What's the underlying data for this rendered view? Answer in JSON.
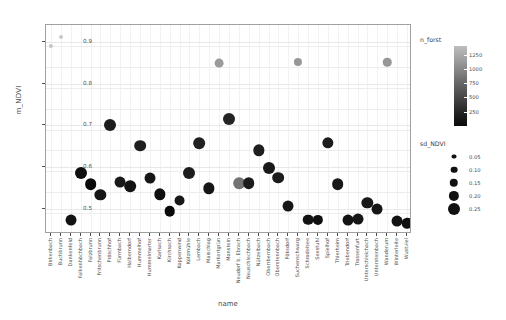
{
  "chart_data": {
    "type": "scatter",
    "title": "",
    "xlabel": "name",
    "ylabel": "m_NDVI",
    "ylim": [
      0.44,
      0.94
    ],
    "yticks": [
      0.5,
      0.6,
      0.7,
      0.8,
      0.9
    ],
    "ytick_labels": [
      "0.5",
      "0.6",
      "0.7",
      "0.8",
      "0.9"
    ],
    "grid": true,
    "legend_position": "right",
    "categories": [
      "Birkenbach",
      "Buchbrunn",
      "Dankenfeld",
      "Falkenhöchbach",
      "Falzbrunn",
      "Fritschenbrunn",
      "Pröschhof",
      "Fürmbach",
      "Halberndorf",
      "Hummelhof",
      "Hummelmarter",
      "Karlsach",
      "Kirchsach",
      "Koppenwind",
      "Kotzmühle",
      "Lembach",
      "Maischlag",
      "Markertgrün",
      "Monstein",
      "Neudorf b. Ebrach",
      "Neuschlechbach",
      "Nützelbach",
      "Oberrbernbach",
      "Oberstennbach",
      "Pöksdorf",
      "Suchenschwarg",
      "Schrodelsee",
      "Seestuhl",
      "Spielhof",
      "Thierheim",
      "Triebendorf",
      "Trossenfurt",
      "Unterschleichach",
      "Untersteinbach",
      "Wanderum",
      "Winterleite",
      "Wustviel"
    ],
    "points": [
      {
        "name": "Birkenbach",
        "m_NDVI": 0.89,
        "sd_NDVI": 0.03,
        "n_forst": 1230
      },
      {
        "name": "Buchbrunn",
        "m_NDVI": 0.912,
        "sd_NDVI": 0.02,
        "n_forst": 1250
      },
      {
        "name": "Dankenfeld",
        "m_NDVI": 0.473,
        "sd_NDVI": 0.22,
        "n_forst": 120
      },
      {
        "name": "Falkenhöchbach",
        "m_NDVI": 0.587,
        "sd_NDVI": 0.25,
        "n_forst": 110
      },
      {
        "name": "Falzbrunn",
        "m_NDVI": 0.559,
        "sd_NDVI": 0.24,
        "n_forst": 100
      },
      {
        "name": "Fritschenbrunn",
        "m_NDVI": 0.534,
        "sd_NDVI": 0.23,
        "n_forst": 130
      },
      {
        "name": "Pröschhof",
        "m_NDVI": 0.7,
        "sd_NDVI": 0.25,
        "n_forst": 150
      },
      {
        "name": "Fürmbach",
        "m_NDVI": 0.565,
        "sd_NDVI": 0.22,
        "n_forst": 140
      },
      {
        "name": "Halberndorf",
        "m_NDVI": 0.555,
        "sd_NDVI": 0.24,
        "n_forst": 120
      },
      {
        "name": "Hummelhof",
        "m_NDVI": 0.651,
        "sd_NDVI": 0.24,
        "n_forst": 160
      },
      {
        "name": "Hummelmarter",
        "m_NDVI": 0.575,
        "sd_NDVI": 0.22,
        "n_forst": 130
      },
      {
        "name": "Karlsach",
        "m_NDVI": 0.535,
        "sd_NDVI": 0.23,
        "n_forst": 110
      },
      {
        "name": "Kirchsach",
        "m_NDVI": 0.494,
        "sd_NDVI": 0.21,
        "n_forst": 100
      },
      {
        "name": "Koppenwind",
        "m_NDVI": 0.52,
        "sd_NDVI": 0.22,
        "n_forst": 140
      },
      {
        "name": "Kotzmühle",
        "m_NDVI": 0.587,
        "sd_NDVI": 0.25,
        "n_forst": 150
      },
      {
        "name": "Lembach",
        "m_NDVI": 0.657,
        "sd_NDVI": 0.24,
        "n_forst": 170
      },
      {
        "name": "Maischlag",
        "m_NDVI": 0.549,
        "sd_NDVI": 0.23,
        "n_forst": 130
      },
      {
        "name": "Markertgrün",
        "m_NDVI": 0.848,
        "sd_NDVI": 0.16,
        "n_forst": 900
      },
      {
        "name": "Monstein",
        "m_NDVI": 0.716,
        "sd_NDVI": 0.25,
        "n_forst": 180
      },
      {
        "name": "Neudorf b. Ebrach",
        "m_NDVI": 0.561,
        "sd_NDVI": 0.24,
        "n_forst": 620
      },
      {
        "name": "Neuschlechbach",
        "m_NDVI": 0.562,
        "sd_NDVI": 0.24,
        "n_forst": 150
      },
      {
        "name": "Nützelbach",
        "m_NDVI": 0.64,
        "sd_NDVI": 0.23,
        "n_forst": 160
      },
      {
        "name": "Oberrbernbach",
        "m_NDVI": 0.597,
        "sd_NDVI": 0.25,
        "n_forst": 140
      },
      {
        "name": "Oberstennbach",
        "m_NDVI": 0.575,
        "sd_NDVI": 0.24,
        "n_forst": 150
      },
      {
        "name": "Pöksdorf",
        "m_NDVI": 0.506,
        "sd_NDVI": 0.22,
        "n_forst": 130
      },
      {
        "name": "Suchenschwarg",
        "m_NDVI": 0.852,
        "sd_NDVI": 0.14,
        "n_forst": 880
      },
      {
        "name": "Schrodelsee",
        "m_NDVI": 0.474,
        "sd_NDVI": 0.21,
        "n_forst": 120
      },
      {
        "name": "Seestuhl",
        "m_NDVI": 0.473,
        "sd_NDVI": 0.2,
        "n_forst": 110
      },
      {
        "name": "Spielhof",
        "m_NDVI": 0.658,
        "sd_NDVI": 0.23,
        "n_forst": 150
      },
      {
        "name": "Thierheim",
        "m_NDVI": 0.559,
        "sd_NDVI": 0.24,
        "n_forst": 140
      },
      {
        "name": "Triebendorf",
        "m_NDVI": 0.474,
        "sd_NDVI": 0.22,
        "n_forst": 120
      },
      {
        "name": "Trossenfurt",
        "m_NDVI": 0.476,
        "sd_NDVI": 0.22,
        "n_forst": 130
      },
      {
        "name": "Unterschleichach",
        "m_NDVI": 0.514,
        "sd_NDVI": 0.23,
        "n_forst": 140
      },
      {
        "name": "Untersteinbach",
        "m_NDVI": 0.499,
        "sd_NDVI": 0.22,
        "n_forst": 130
      },
      {
        "name": "Wanderum",
        "m_NDVI": 0.851,
        "sd_NDVI": 0.15,
        "n_forst": 870
      },
      {
        "name": "Winterleite",
        "m_NDVI": 0.47,
        "sd_NDVI": 0.22,
        "n_forst": 120
      },
      {
        "name": "Wustviel",
        "m_NDVI": 0.466,
        "sd_NDVI": 0.21,
        "n_forst": 110
      }
    ]
  },
  "legends": {
    "color": {
      "title": "n_forst",
      "ticks": [
        1250,
        1000,
        750,
        500,
        250
      ],
      "tick_labels": [
        "1250",
        "1000",
        "750",
        "500",
        "250"
      ],
      "low_color": "#000000",
      "high_color": "#cccccc"
    },
    "size": {
      "title": "sd_NDVI",
      "breaks": [
        0.05,
        0.1,
        0.15,
        0.2,
        0.25
      ],
      "break_labels": [
        "0.05",
        "0.10",
        "0.15",
        "0.20",
        "0.25"
      ],
      "dot_color": "#111111"
    }
  },
  "axes": {
    "y_title": "m_NDVI",
    "x_title": "name"
  }
}
